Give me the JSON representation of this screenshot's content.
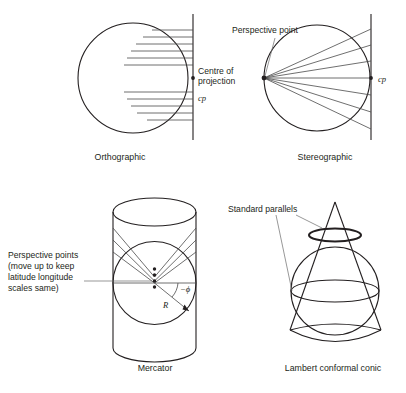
{
  "figure": {
    "background_color": "#ffffff",
    "ink_color": "#231f20",
    "ray_color": "#4a4a4a",
    "leader_color": "#6b6b6b"
  },
  "panels": {
    "orthographic": {
      "caption": "Orthographic",
      "annotation_line1": "Centre of",
      "annotation_line2": "projection",
      "annotation_symbol": "cp",
      "projection_ray_count": 11,
      "ray_direction": "horizontal-parallel",
      "surface": "tangent plane (vertical line)"
    },
    "stereographic": {
      "caption": "Stereographic",
      "annotation": "Perspective point",
      "annotation_symbol": "cp",
      "projection_ray_count": 7,
      "ray_direction": "fan from antipodal point",
      "surface": "tangent plane (vertical line)"
    },
    "mercator": {
      "caption": "Mercator",
      "annotation_line1": "Perspective points",
      "annotation_line2": "(move up to keep",
      "annotation_line3": "latitude longitude",
      "annotation_line4": "scales same)",
      "angle_label": "−ϕ",
      "radius_label": "R",
      "perspective_point_count": 4,
      "projection_ray_count": 6,
      "surface": "tangent cylinder"
    },
    "lambert": {
      "caption": "Lambert conformal conic",
      "annotation": "Standard parallels",
      "standard_parallel_count": 2,
      "surface": "secant cone"
    }
  }
}
